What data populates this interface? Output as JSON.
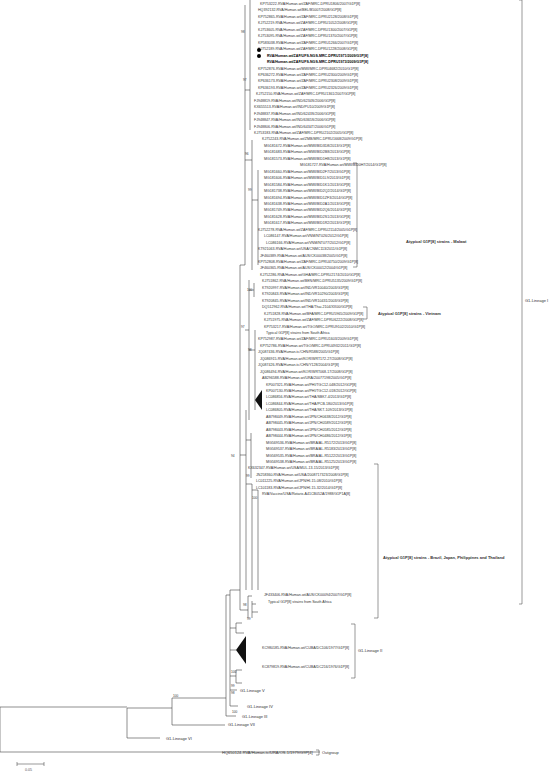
{
  "figure": {
    "type": "phylogenetic-tree",
    "scale_bar": {
      "label": "0.05"
    },
    "outgroup": {
      "leaf": "HQ650124-RVA/Human-tc/URA/OS-1/1979/G9P[4]",
      "label": "Outgroup"
    },
    "clade_labels": {
      "malawi": "Atypical G1P[8] strains - Malawi",
      "vietnam": "Atypical G1P[8] strains - Vietnam",
      "brazil_japan": "Atypical G1P[8] strains - Brazil, Japan, Philippines and Thailand",
      "lineage_1": "G1-Lineage I",
      "lineage_2": "G1-Lineage II",
      "lineage_3": "G1-Lineage III",
      "lineage_4": "G1-Lineage IV",
      "lineage_5": "G1-Lineage V",
      "lineage_6": "G1-Lineage VI",
      "lineage_7": "G1-Lineage VII",
      "typical_sa_1": "Typical G1P[8] strains from South Africa",
      "typical_sa_2": "Typical G1P[8] strains from South Africa"
    },
    "bootstrap_values": [
      "98",
      "97",
      "99",
      "96",
      "100",
      "98",
      "97",
      "99",
      "100",
      "94",
      "98",
      "99",
      "100",
      "99",
      "98",
      "100",
      "100"
    ],
    "leaves": [
      {
        "label": "KP753222-RVA/Human-wt/ZAF/MRC-DPRU1806/2007/G1P[8]"
      },
      {
        "label": "HQ392132-RVA/Human-wt/BEL/B5007/2008/G1P[8]"
      },
      {
        "label": "KP752865-RVA/Human-wt/ZAF/MRC-DPRU2128/2008/G1P[8]"
      },
      {
        "label": "KJ752219-RVA/Human-wt/ZAF/MRC-DPRU1052/2008/G1P[8]"
      },
      {
        "label": "KJ753605-RVA/Human-wt/ZAF/MRC-DPRU1300/2007/G1P[8]"
      },
      {
        "label": "KJ753095-RVA/Human-wt/ZAF/MRC-DPRU1370/2007/G1P[8]"
      },
      {
        "label": "KP583038-RVA/Human-wt/ZAF/MRC-DPRU1266/2007/G1P[8]"
      },
      {
        "label": "KJ752189-RVA/Human-wt/ZAF/MRC-DPRU1228/2008/G1P[8]"
      },
      {
        "label": "RVA/Human-wt/ZAF/UFS-NGS-MRC-DPRU1971/2009/G1P[8]",
        "bold": true,
        "marker": "dot"
      },
      {
        "label": "RVA/Human-wt/ZAF/UFS-NGS-MRC-DPRU1973/2009/G1P[8]",
        "bold": true,
        "marker": "dot"
      },
      {
        "label": "KP752876-RVA/Human-wt/MWI/MRC-DPRU4682/2010/G1P[8]"
      },
      {
        "label": "KP636272-RVA/Human-wt/ZAF/MRC-DPRU2300/2009/G1P[8]"
      },
      {
        "label": "KP636173-RVA/Human-wt/ZAF/MRC-DPRU2308/2009/G1P[8]"
      },
      {
        "label": "KP636193-RVA/Human-wt/ZAF/MRC-DPRU2326/2009/G1P[8]"
      },
      {
        "label": "KJ752150-RVA/Human-wt/ZAF/MRC-DPRU1361/2007/G1P[8]"
      },
      {
        "label": "FJ948819-RVA/Human-wt/IND/6234S/2006/G1P[8]"
      },
      {
        "label": "KX655513-RVA/Human-wt/IND/PU10/2009/G1P[8]"
      },
      {
        "label": "FJ948837-RVA/Human-wt/IND/6243S/2006/G1P[8]"
      },
      {
        "label": "FJ948847-RVA/Human-wt/IND/6365S/2006/G1P[8]"
      },
      {
        "label": "FJ948806-RVA/Human-wt/IND/6434T/2006/G1P[8]"
      },
      {
        "label": "KJ753183-RVA/Human-wt/ZAF/MRC-DPRU2102/2005/G1P[8]"
      },
      {
        "label": "KJ752243-RVA/Human-wt/ZMB/MRC-DPRU1668/2009/G1P[8]"
      },
      {
        "label": "MG181672-RVA/Human-wt/MWI/BID3D8/2013/G1P[8]"
      },
      {
        "label": "MG181683-RVA/Human-wt/MWI/BID2B8/2013/G1P[8]"
      },
      {
        "label": "MG181573-RVA/Human-wt/MWI/BID1H8/2013/G1P[8]"
      },
      {
        "label": "MG181727-RVA/Human-wt/MWI/BID0H7/2014/G1P[8]"
      },
      {
        "label": "MG181660-RVA/Human-wt/MWI/BID2F7/2013/G1P[8]"
      },
      {
        "label": "MG181606-RVA/Human-wt/MWI/BID1L9/2013/G1P[8]"
      },
      {
        "label": "MG181584-RVA/Human-wt/MWI/BID1K1/2013/G1P[8]"
      },
      {
        "label": "MG181738-RVA/Human-wt/MWI/BID2Q2/2014/G1P[8]"
      },
      {
        "label": "MG181694-RVA/Human-wt/MWI/BID1ZF3/2014/G1P[8]"
      },
      {
        "label": "MG181638-RVA/Human-wt/MWI/BID2A1/2013/G1P[8]"
      },
      {
        "label": "MG181749-RVA/Human-wt/MWI/BID2Q6/2014/G1P[8]"
      },
      {
        "label": "MG181628-RVA/Human-wt/MWI/BID2S1/2013/G1P[8]"
      },
      {
        "label": "MG181617-RVA/Human-wt/MWI/BID1R2/2013/G1P[8]"
      },
      {
        "label": "KJ752278-RVA/Human-wt/ZAF/MRC-DPRU2114/2005/G1P[8]"
      },
      {
        "label": "LC086147-RVA/Human-wt/VNM/NT026/2012/G1P[8]"
      },
      {
        "label": "LC086166-RVA/Human-wt/VNM/NT077/2012/G1P[8]"
      },
      {
        "label": "KT921063-RVA/Human-wt/USA/CNMC113/2011/G1P[8]"
      },
      {
        "label": "JF460389-RVA/Human-wt/AUS/CK00038/2005/G1P[8]"
      },
      {
        "label": "KP752808-RVA/Human-wt/ZAF/MRC-DPRU4750/2009/G1P[8]"
      },
      {
        "label": "JF460365-RVA/Human-wt/AUS/CK00012/2004/G1P[8]"
      },
      {
        "label": "KJ752286-RVA/Human-wt/GHA/MRC-DPRU2174/2010/G1P[8]"
      },
      {
        "label": "KJ751862-RVA/Human-wt/BEN/MRC-DPRU5135/2009/G1P[8]"
      },
      {
        "label": "KT920997-RVA/Human-wt/IND/VR10040/2003/G1P[8]"
      },
      {
        "label": "KT920843-RVA/Human-wt/IND/VR10290/2003/G1P[8]"
      },
      {
        "label": "KT920845-RVA/Human-wt/IND/VR10431/2003/G1P[8]"
      },
      {
        "label": "DQ512962-RVA/Human-wt/THA/Thai-2104/XX00/G1P[8]"
      },
      {
        "label": "KJ751828-RVA/Human-wt/BFA/MRC-DPRU5965/2009/G1P[8]"
      },
      {
        "label": "KJ751975-RVA/Human-wt/ZAF/MRC-DPRU6222/2008/G1P[8]"
      },
      {
        "label": "KP753217-RVA/Human-wt/TGO/MRC-DPRU9102/2010/G1P[8]"
      },
      {
        "label": "Typical G1P[8] strains from South Africa",
        "collapsed": true
      },
      {
        "label": "KP752987-RVA/Human-wt/ZAF/MRC-DPRU1603/2009/G1P[8]"
      },
      {
        "label": "KP752786-RVA/Human-wt/TGO/MRC-DPRU4932/2011/G1P[8]"
      },
      {
        "label": "JQ087436-RVA/Human-tc/CHN/R588/2005/G1P[8]"
      },
      {
        "label": "JQ086915-RVA/Human-wt/KOR/WRT172-27/2008/G1P[8]"
      },
      {
        "label": "JQ087426-RVA/Human-tc/CHN/Y128/2004/G1P[8]"
      },
      {
        "label": "JQ086494-RVA/Human-wt/KOR/WRT068-17/2008/G1P[8]"
      },
      {
        "label": "AB296588-RVA/Human-wt/URA/20077198/2005/G1P[8]"
      },
      {
        "label": "KP007321-RVA/Human-wt/PHI/TGC12-048/2012/G1P[8]"
      },
      {
        "label": "KP007130-RVA/Human-wt/PHI/TGC12-018/2012/G1P[8]"
      },
      {
        "label": "LC086856-RVA/Human-wt/THA/SBK7-4/2013/G1P[8]"
      },
      {
        "label": "LC086844-RVA/Human-wt/THA/PCB-180/2013/G1P[8]"
      },
      {
        "label": "LC086805-RVA/Human-wt/THA/SKT-109/2013/G1P[8]"
      },
      {
        "label": "AB798449-RVA/Human-wt/JPN/CH0638/2012/G1P[8]"
      },
      {
        "label": "AB798445-RVA/Human-wt/JPN/CH0589/2012/G1P[8]"
      },
      {
        "label": "AB798443-RVA/Human-wt/JPN/CH0585/2012/G1P[8]"
      },
      {
        "label": "AB798444-RVA/Human-wt/JPN/CH0486/2012/G1P[8]"
      },
      {
        "label": "MG569536-RVA/Human-wt/BRA/AL-R5172/2013/G1P[8]"
      },
      {
        "label": "MG569537-RVA/Human-wt/BRA/AL-R5183/2013/G1P[8]"
      },
      {
        "label": "MG569535-RVA/Human-wt/BRA/AL-R5122/2013/G1P[8]"
      },
      {
        "label": "MG569538-RVA/Human-wt/BRA/AL-R5125/2013/G1P[8]"
      },
      {
        "label": "KX632347-RVA/Human-wt/USA/MUL-13-15/2013/G1P[8]"
      },
      {
        "label": "JN258360-RVA/Human-wt/USA/2008717323/2008/G1P[8]"
      },
      {
        "label": "LC011225-RVA/Human-wt/JPN/HI-15-08/2010/G1P[8]"
      },
      {
        "label": "LC101183-RVA/Human-wt/JPN/HI-15-32/2014/G1P[8]"
      },
      {
        "label": "RVA/Vaccine/USA/Rotarix-A41CB052A/1988/G1P1A[8]"
      },
      {
        "label": "JF433406-RVA/Human-wt/AUS/CK00094/2007/G1P[8]"
      },
      {
        "label": "Typical G1P[8] strains from South Africa",
        "collapsed": true
      },
      {
        "label": "KC980185-RVA/Human-wt/CUBA/DC106/1977/G1P[8]"
      },
      {
        "label": "KC879819-RVA/Human-wt/CUBA/DC216/1976/G1P[8]"
      }
    ]
  }
}
